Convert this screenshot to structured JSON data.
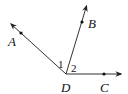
{
  "diagram": {
    "type": "geometry-angles",
    "vertex": {
      "label": "D",
      "x": 66,
      "y": 74
    },
    "rays": [
      {
        "name": "DA",
        "point_label": "A",
        "tip": [
          10,
          23
        ],
        "dot": [
          21,
          33
        ],
        "label_pos": [
          9,
          46
        ]
      },
      {
        "name": "DB",
        "point_label": "B",
        "tip": [
          87,
          5
        ],
        "dot": [
          82,
          22
        ],
        "label_pos": [
          88,
          28
        ]
      },
      {
        "name": "DC",
        "point_label": "C",
        "tip": [
          122,
          74
        ],
        "dot": [
          104,
          74
        ],
        "label_pos": [
          100,
          92
        ]
      }
    ],
    "angles": [
      {
        "label": "1",
        "between": [
          "DA",
          "DB"
        ],
        "label_pos": [
          58,
          68
        ]
      },
      {
        "label": "2",
        "between": [
          "DB",
          "DC"
        ],
        "label_pos": [
          71,
          71
        ]
      }
    ],
    "colors": {
      "line": "#333333",
      "text": "#111111"
    }
  },
  "labels": {
    "A": "A",
    "B": "B",
    "C": "C",
    "D": "D",
    "angle1": "1",
    "angle2": "2"
  }
}
